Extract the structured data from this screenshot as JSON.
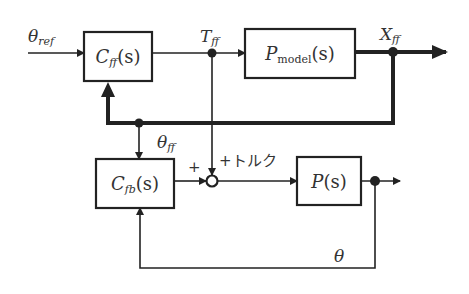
{
  "diagram": {
    "blocks": {
      "cff": {
        "main": "C",
        "sub": "ff",
        "arg": "(s)"
      },
      "pmodel": {
        "main": "P",
        "sub": "model",
        "arg": "(s)"
      },
      "cfb": {
        "main": "C",
        "sub": "fb",
        "arg": "(s)"
      },
      "p": {
        "main": "P",
        "arg": "(s)"
      }
    },
    "signals": {
      "theta_ref": {
        "main": "θ",
        "sub": "ref"
      },
      "t_ff": {
        "main": "T",
        "sub": "ff"
      },
      "x_ff": {
        "main": "X",
        "sub": "ff"
      },
      "theta_ff": {
        "main": "θ",
        "sub": "ff"
      },
      "theta": {
        "main": "θ"
      },
      "torque": "+トルク",
      "plus_left": "+"
    },
    "colors": {
      "line": "#222222",
      "fill": "#ffffff"
    }
  }
}
